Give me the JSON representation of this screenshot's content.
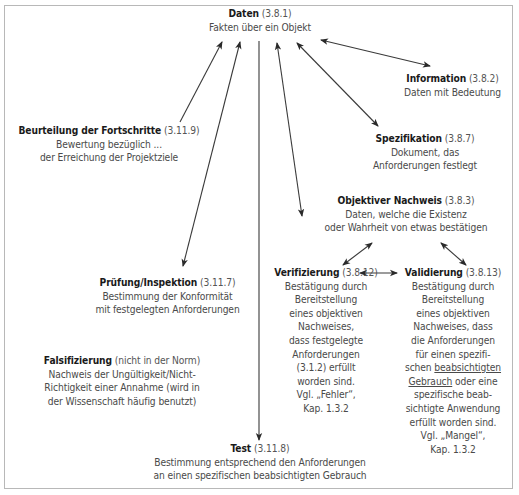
{
  "nodes": {
    "daten": {
      "title": "Daten",
      "ref": "(3.8.1)",
      "desc": "Fakten über ein Objekt"
    },
    "information": {
      "title": "Information",
      "ref": "(3.8.2)",
      "desc": "Daten mit Bedeutung"
    },
    "beurteilung": {
      "title": "Beurteilung der Fortschritte",
      "ref": "(3.11.9)",
      "desc": "Bewertung bezüglich ...\nder Erreichung der Projektziele"
    },
    "spezifikation": {
      "title": "Spezifikation",
      "ref": "(3.8.7)",
      "desc": "Dokument, das\nAnforderungen festlegt"
    },
    "objektiver_nachweis": {
      "title": "Objektiver Nachweis",
      "ref": "(3.8.3)",
      "desc": "Daten, welche die Existenz\noder Wahrheit von etwas bestätigen"
    },
    "pruefung": {
      "title": "Prüfung/Inspektion",
      "ref": "(3.11.7)",
      "desc": "Bestimmung der Konformität\nmit festgelegten Anforderungen"
    },
    "verifizierung": {
      "title": "Verifizierung",
      "ref": "(3.8.12)",
      "desc": "Bestätigung durch\nBereitstellung\neines objektiven\nNachweises,\ndass festgelegte\nAnforderungen\n(3.1.2) erfüllt\nworden sind.\nVgl. „Fehler“,\nKap. 1.3.2"
    },
    "validierung": {
      "title": "Validierung",
      "ref": "(3.8.13)",
      "desc_before": "Bestätigung durch\nBereitstellung\neines objektiven\nNachweises, dass\ndie Anforderungen\nfür einen spezifi-\nschen ",
      "desc_underlined": "beabsichtigten\nGebrauch",
      "desc_after": " oder eine\nspezifische beab-\nsichtigte Anwendung\nerfüllt worden sind.\nVgl. „Mangel“,\nKap. 1.3.2"
    },
    "falsifizierung": {
      "title": "Falsifizierung",
      "ref": "(nicht in der Norm)",
      "desc": "Nachweis der Ungültigkeit/Nicht-\nRichtigkeit einer Annahme (wird in\nder Wissenschaft häufig benutzt)"
    },
    "test": {
      "title": "Test",
      "ref": "(3.11.8)",
      "desc": "Bestimmung entsprechend den Anforderungen\nan einen spezifischen beabsichtigten Gebrauch"
    }
  },
  "connections": [
    {
      "from": "beurteilung",
      "to": "daten",
      "type": "directed"
    },
    {
      "from": "pruefung",
      "to": "daten",
      "type": "bidirectional"
    },
    {
      "from": "daten",
      "to": "test",
      "type": "directed"
    },
    {
      "from": "objektiver_nachweis",
      "to": "daten",
      "type": "bidirectional"
    },
    {
      "from": "spezifikation",
      "to": "daten",
      "type": "bidirectional"
    },
    {
      "from": "information",
      "to": "daten",
      "type": "bidirectional"
    },
    {
      "from": "objektiver_nachweis",
      "to": "verifizierung",
      "type": "bidirectional"
    },
    {
      "from": "objektiver_nachweis",
      "to": "validierung",
      "type": "bidirectional"
    },
    {
      "from": "verifizierung",
      "to": "validierung",
      "type": "bidirectional"
    }
  ]
}
